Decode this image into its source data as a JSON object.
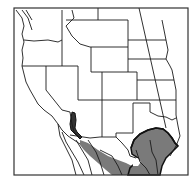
{
  "map": {
    "type": "species-range-map",
    "region": "Western United States and northern Mexico",
    "colors": {
      "background": "#ffffff",
      "border": "#1a1a1a",
      "range_fill": "#7a7a7a",
      "range_outline": "#111111"
    },
    "layers": {
      "frame": "map-frame",
      "state_borders": "state-boundaries",
      "meridian_line": "100th-meridian-line",
      "range": "species-range"
    },
    "range_areas": [
      {
        "id": "california-strip",
        "label": "Range - southern California strip"
      },
      {
        "id": "sonora-band",
        "label": "Range - Sonora/Chihuahua band"
      },
      {
        "id": "texas-mexico-core",
        "label": "Range - south Texas / northeastern Mexico"
      }
    ]
  }
}
